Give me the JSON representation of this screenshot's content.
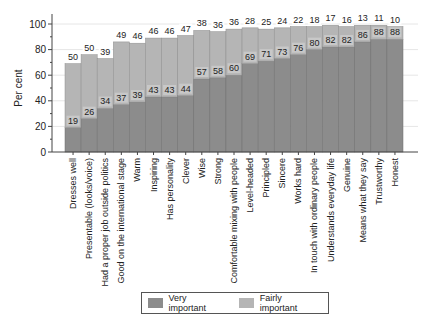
{
  "chart_data": {
    "type": "bar",
    "stacked": true,
    "title": "",
    "xlabel": "",
    "ylabel": "Per cent",
    "ylim": [
      0,
      100
    ],
    "yticks": [
      0,
      20,
      40,
      60,
      80,
      100
    ],
    "grid": true,
    "legend_position": "bottom",
    "categories": [
      "Dresses well",
      "Presentable (looks/voice)",
      "Had a proper job outside politics",
      "Good on the international stage",
      "Warm",
      "Inspiring",
      "Has personality",
      "Clever",
      "Wise",
      "Strong",
      "Comfortable mixing with people",
      "Level-headed",
      "Principled",
      "Sincere",
      "Works hard",
      "In touch with ordinary people",
      "Understands everyday life",
      "Genuine",
      "Means what they say",
      "Trustworthy",
      "Honest"
    ],
    "series": [
      {
        "name": "Very important",
        "color": "#8c8c8c",
        "values": [
          19,
          26,
          34,
          37,
          39,
          43,
          43,
          44,
          57,
          58,
          60,
          69,
          71,
          73,
          76,
          80,
          82,
          82,
          86,
          88,
          88
        ]
      },
      {
        "name": "Fairly important",
        "color": "#b5b5b5",
        "values": [
          50,
          50,
          39,
          49,
          46,
          46,
          46,
          47,
          38,
          36,
          36,
          28,
          25,
          24,
          22,
          18,
          17,
          16,
          13,
          11,
          10
        ]
      }
    ]
  },
  "legend": {
    "items": [
      {
        "label": "Very important",
        "color": "#8c8c8c"
      },
      {
        "label": "Fairly important",
        "color": "#b5b5b5"
      }
    ]
  }
}
